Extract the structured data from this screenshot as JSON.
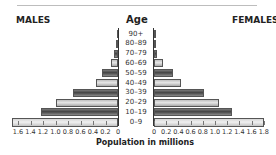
{
  "chart_data": {
    "type": "bar",
    "subtype": "population-pyramid",
    "title": "",
    "left_label": "MALES",
    "center_label": "Age",
    "right_label": "FEMALES",
    "xlabel": "Population in millions",
    "categories": [
      "90+",
      "80–89",
      "70–79",
      "60–69",
      "50–59",
      "40–49",
      "30–39",
      "20–29",
      "10–19",
      "0–9"
    ],
    "series": [
      {
        "name": "MALES",
        "values": [
          0.01,
          0.04,
          0.07,
          0.11,
          0.26,
          0.35,
          0.72,
          0.99,
          1.23,
          1.7
        ]
      },
      {
        "name": "FEMALES",
        "values": [
          0.01,
          0.03,
          0.05,
          0.15,
          0.31,
          0.44,
          0.82,
          1.07,
          1.28,
          1.8
        ]
      }
    ],
    "left_ticks": [
      "1.6",
      "1.4",
      "1.2",
      "1.0",
      "0.8",
      "0.6",
      "0.4",
      "0.2",
      "0"
    ],
    "right_ticks": [
      "0",
      "0.2",
      "0.4",
      "0.6",
      "0.8",
      "1.0",
      "1.2",
      "1.4",
      "1.6",
      "1.8"
    ],
    "xlim_left": [
      0,
      1.6
    ],
    "xlim_right": [
      0,
      1.8
    ],
    "grid": false,
    "legend": "none"
  },
  "labels": {
    "males": "MALES",
    "age": "Age",
    "females": "FEMALES",
    "xlabel": "Population in millions"
  }
}
